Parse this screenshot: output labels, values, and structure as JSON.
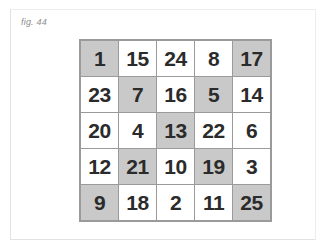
{
  "figure": {
    "caption": "fig. 44",
    "colors": {
      "page_background": "#ffffff",
      "card_background": "#ffffff",
      "card_border": "#e2e2e2",
      "grid_line": "#9a9a9a",
      "cell_background": "#ffffff",
      "cell_shaded_background": "#c9c9c9",
      "number_color": "#2b2b2b",
      "caption_color": "#8d8d8d"
    }
  },
  "grid": {
    "rows": 5,
    "columns": 5,
    "cells": [
      [
        {
          "value": "1",
          "shaded": true
        },
        {
          "value": "15",
          "shaded": false
        },
        {
          "value": "24",
          "shaded": false
        },
        {
          "value": "8",
          "shaded": false
        },
        {
          "value": "17",
          "shaded": true
        }
      ],
      [
        {
          "value": "23",
          "shaded": false
        },
        {
          "value": "7",
          "shaded": true
        },
        {
          "value": "16",
          "shaded": false
        },
        {
          "value": "5",
          "shaded": true
        },
        {
          "value": "14",
          "shaded": false
        }
      ],
      [
        {
          "value": "20",
          "shaded": false
        },
        {
          "value": "4",
          "shaded": false
        },
        {
          "value": "13",
          "shaded": true
        },
        {
          "value": "22",
          "shaded": false
        },
        {
          "value": "6",
          "shaded": false
        }
      ],
      [
        {
          "value": "12",
          "shaded": false
        },
        {
          "value": "21",
          "shaded": true
        },
        {
          "value": "10",
          "shaded": false
        },
        {
          "value": "19",
          "shaded": true
        },
        {
          "value": "3",
          "shaded": false
        }
      ],
      [
        {
          "value": "9",
          "shaded": true
        },
        {
          "value": "18",
          "shaded": false
        },
        {
          "value": "2",
          "shaded": false
        },
        {
          "value": "11",
          "shaded": false
        },
        {
          "value": "25",
          "shaded": true
        }
      ]
    ]
  }
}
